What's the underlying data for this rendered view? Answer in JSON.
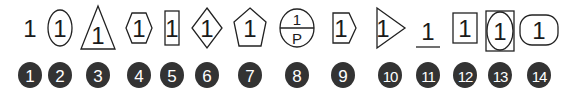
{
  "colors": {
    "badge": "#333333",
    "badge_text": "#ffffff",
    "stroke": "#222222"
  },
  "symbols": [
    {
      "number": "1",
      "shape": "none",
      "label": "1"
    },
    {
      "number": "2",
      "shape": "ellipse",
      "label": "1"
    },
    {
      "number": "3",
      "shape": "triangle",
      "label": "1"
    },
    {
      "number": "4",
      "shape": "hexagon",
      "label": "1"
    },
    {
      "number": "5",
      "shape": "rectangle",
      "label": "1"
    },
    {
      "number": "6",
      "shape": "diamond",
      "label": "1"
    },
    {
      "number": "7",
      "shape": "pentagon",
      "label": "1"
    },
    {
      "number": "8",
      "shape": "split-ellipse",
      "label": "1",
      "sublabel": "P"
    },
    {
      "number": "9",
      "shape": "arrow-pentagon",
      "label": "1"
    },
    {
      "number": "10",
      "shape": "right-triangle-flag",
      "label": "1"
    },
    {
      "number": "11",
      "shape": "underline",
      "label": "1"
    },
    {
      "number": "12",
      "shape": "rectangle",
      "label": "1"
    },
    {
      "number": "13",
      "shape": "ellipse-in-rectangle",
      "label": "1"
    },
    {
      "number": "14",
      "shape": "rounded-rectangle",
      "label": "1"
    }
  ]
}
